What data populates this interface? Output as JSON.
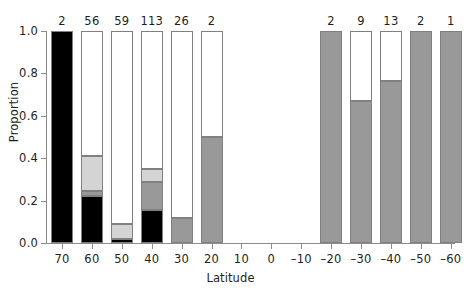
{
  "chart_data": {
    "type": "bar",
    "subtype": "stacked-proportion",
    "title": "",
    "xlabel": "Latitude",
    "ylabel": "Proportion",
    "ylim": [
      0.0,
      1.0
    ],
    "yticks": [
      "0.0",
      "0.2",
      "0.4",
      "0.6",
      "0.8",
      "1.0"
    ],
    "ytick_values": [
      0.0,
      0.2,
      0.4,
      0.6,
      0.8,
      1.0
    ],
    "grid": false,
    "legend": "none",
    "categories": [
      "70",
      "60",
      "50",
      "40",
      "30",
      "20",
      "10",
      "0",
      "–10",
      "–20",
      "–30",
      "–40",
      "–50",
      "–60"
    ],
    "category_values": [
      70,
      60,
      50,
      40,
      30,
      20,
      10,
      0,
      -10,
      -20,
      -30,
      -40,
      -50,
      -60
    ],
    "counts": [
      "2",
      "56",
      "59",
      "113",
      "26",
      "2",
      "",
      "",
      "",
      "2",
      "9",
      "13",
      "2",
      "1"
    ],
    "count_values": [
      2,
      56,
      59,
      113,
      26,
      2,
      null,
      null,
      null,
      2,
      9,
      13,
      2,
      1
    ],
    "series": [
      {
        "name": "black",
        "color": "#000000",
        "values": [
          1.0,
          0.22,
          0.02,
          0.155,
          0.0,
          0.0,
          null,
          null,
          null,
          0.0,
          0.0,
          0.0,
          0.0,
          0.0
        ]
      },
      {
        "name": "dark-gray",
        "color": "#999999",
        "values": [
          0.0,
          0.025,
          0.0,
          0.135,
          0.12,
          0.5,
          null,
          null,
          null,
          1.0,
          0.67,
          0.765,
          1.0,
          1.0
        ]
      },
      {
        "name": "light-gray",
        "color": "#d4d4d4",
        "values": [
          0.0,
          0.165,
          0.07,
          0.06,
          0.0,
          0.0,
          null,
          null,
          null,
          0.0,
          0.0,
          0.0,
          0.0,
          0.0
        ]
      },
      {
        "name": "white",
        "color": "#ffffff",
        "values": [
          0.0,
          0.59,
          0.91,
          0.65,
          0.88,
          0.5,
          null,
          null,
          null,
          0.0,
          0.33,
          0.235,
          0.0,
          0.0
        ]
      }
    ],
    "bars": [
      {
        "category": "70",
        "count": "2",
        "segments": [
          {
            "series": "black",
            "from": 0.0,
            "to": 1.0
          }
        ]
      },
      {
        "category": "60",
        "count": "56",
        "segments": [
          {
            "series": "black",
            "from": 0.0,
            "to": 0.22
          },
          {
            "series": "dark-gray",
            "from": 0.22,
            "to": 0.245
          },
          {
            "series": "light-gray",
            "from": 0.245,
            "to": 0.41
          },
          {
            "series": "white",
            "from": 0.41,
            "to": 1.0
          }
        ]
      },
      {
        "category": "50",
        "count": "59",
        "segments": [
          {
            "series": "black",
            "from": 0.0,
            "to": 0.02
          },
          {
            "series": "light-gray",
            "from": 0.02,
            "to": 0.09
          },
          {
            "series": "white",
            "from": 0.09,
            "to": 1.0
          }
        ]
      },
      {
        "category": "40",
        "count": "113",
        "segments": [
          {
            "series": "black",
            "from": 0.0,
            "to": 0.155
          },
          {
            "series": "dark-gray",
            "from": 0.155,
            "to": 0.29
          },
          {
            "series": "light-gray",
            "from": 0.29,
            "to": 0.35
          },
          {
            "series": "white",
            "from": 0.35,
            "to": 1.0
          }
        ]
      },
      {
        "category": "30",
        "count": "26",
        "segments": [
          {
            "series": "dark-gray",
            "from": 0.0,
            "to": 0.12
          },
          {
            "series": "white",
            "from": 0.12,
            "to": 1.0
          }
        ]
      },
      {
        "category": "20",
        "count": "2",
        "segments": [
          {
            "series": "dark-gray",
            "from": 0.0,
            "to": 0.5
          },
          {
            "series": "white",
            "from": 0.5,
            "to": 1.0
          }
        ]
      },
      {
        "category": "10",
        "count": "",
        "segments": []
      },
      {
        "category": "0",
        "count": "",
        "segments": []
      },
      {
        "category": "–10",
        "count": "",
        "segments": []
      },
      {
        "category": "–20",
        "count": "2",
        "segments": [
          {
            "series": "dark-gray",
            "from": 0.0,
            "to": 1.0
          }
        ]
      },
      {
        "category": "–30",
        "count": "9",
        "segments": [
          {
            "series": "dark-gray",
            "from": 0.0,
            "to": 0.67
          },
          {
            "series": "white",
            "from": 0.67,
            "to": 1.0
          }
        ]
      },
      {
        "category": "–40",
        "count": "13",
        "segments": [
          {
            "series": "dark-gray",
            "from": 0.0,
            "to": 0.765
          },
          {
            "series": "white",
            "from": 0.765,
            "to": 1.0
          }
        ]
      },
      {
        "category": "–50",
        "count": "2",
        "segments": [
          {
            "series": "dark-gray",
            "from": 0.0,
            "to": 1.0
          }
        ]
      },
      {
        "category": "–60",
        "count": "1",
        "segments": [
          {
            "series": "dark-gray",
            "from": 0.0,
            "to": 1.0
          }
        ]
      }
    ]
  },
  "colors": {
    "axis": "#8b8b8b",
    "text": "#231f20",
    "background": "#ffffff",
    "bar_outline": "#808080",
    "black": "#000000",
    "dark_gray": "#999999",
    "light_gray": "#d4d4d4",
    "white": "#ffffff"
  }
}
